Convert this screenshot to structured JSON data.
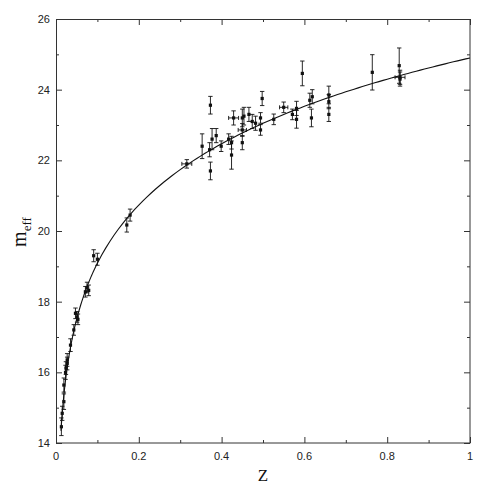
{
  "chart_data": {
    "type": "scatter",
    "title": "",
    "xlabel": "Z",
    "ylabel": "m_eff",
    "ylabel_main": "m",
    "ylabel_sub": "eff",
    "xlim": [
      0,
      1
    ],
    "ylim": [
      14,
      26
    ],
    "x_ticks": [
      0,
      0.2,
      0.4,
      0.6,
      0.8,
      1
    ],
    "x_tick_labels": [
      "0",
      "0.2",
      "0.4",
      "0.6",
      "0.8",
      "1"
    ],
    "x_minor_ticks": [
      0.1,
      0.3,
      0.5,
      0.7,
      0.9
    ],
    "y_ticks": [
      14,
      16,
      18,
      20,
      22,
      24,
      26
    ],
    "y_tick_labels": [
      "14",
      "16",
      "18",
      "20",
      "22",
      "24",
      "26"
    ],
    "y_minor_ticks": [
      15,
      17,
      19,
      21,
      23,
      25
    ],
    "grid": false,
    "legend": null,
    "fit_curve": {
      "description": "Best-fit magnitude-redshift relation (flat cosmology)",
      "omega_m": 0.28,
      "omega_lambda": 0.72,
      "M_offset": 23.93,
      "z_range": [
        0.008,
        1.0
      ]
    },
    "series": [
      {
        "name": "Supernovae",
        "points": [
          {
            "z": 0.013,
            "m": 14.46,
            "err": 0.25
          },
          {
            "z": 0.015,
            "m": 14.84,
            "err": 0.2
          },
          {
            "z": 0.019,
            "m": 15.17,
            "err": 0.22
          },
          {
            "z": 0.019,
            "m": 15.64,
            "err": 0.2
          },
          {
            "z": 0.023,
            "m": 16.0,
            "err": 0.2
          },
          {
            "z": 0.024,
            "m": 16.12,
            "err": 0.18
          },
          {
            "z": 0.027,
            "m": 16.25,
            "err": 0.18
          },
          {
            "z": 0.027,
            "m": 16.35,
            "err": 0.18
          },
          {
            "z": 0.035,
            "m": 16.77,
            "err": 0.18
          },
          {
            "z": 0.043,
            "m": 17.2,
            "err": 0.15
          },
          {
            "z": 0.047,
            "m": 17.67,
            "err": 0.15
          },
          {
            "z": 0.051,
            "m": 17.57,
            "err": 0.15
          },
          {
            "z": 0.053,
            "m": 17.5,
            "err": 0.15
          },
          {
            "z": 0.071,
            "m": 18.28,
            "err": 0.15
          },
          {
            "z": 0.075,
            "m": 18.4,
            "err": 0.15
          },
          {
            "z": 0.079,
            "m": 18.32,
            "err": 0.15
          },
          {
            "z": 0.091,
            "m": 19.3,
            "err": 0.17
          },
          {
            "z": 0.1,
            "m": 19.2,
            "err": 0.17
          },
          {
            "z": 0.171,
            "m": 20.17,
            "err": 0.2
          },
          {
            "z": 0.179,
            "m": 20.45,
            "err": 0.17
          },
          {
            "z": 0.316,
            "m": 21.9,
            "err": 0.12,
            "xerr": 0.012
          },
          {
            "z": 0.353,
            "m": 22.4,
            "err": 0.35
          },
          {
            "z": 0.371,
            "m": 22.3,
            "err": 0.2
          },
          {
            "z": 0.373,
            "m": 23.56,
            "err": 0.25
          },
          {
            "z": 0.373,
            "m": 21.7,
            "err": 0.25
          },
          {
            "z": 0.377,
            "m": 22.6,
            "err": 0.3
          },
          {
            "z": 0.387,
            "m": 22.7,
            "err": 0.2
          },
          {
            "z": 0.399,
            "m": 22.4,
            "err": 0.15
          },
          {
            "z": 0.417,
            "m": 22.6,
            "err": 0.15
          },
          {
            "z": 0.424,
            "m": 22.15,
            "err": 0.4
          },
          {
            "z": 0.424,
            "m": 22.5,
            "err": 0.18
          },
          {
            "z": 0.429,
            "m": 23.2,
            "err": 0.2,
            "xerr": 0.012
          },
          {
            "z": 0.45,
            "m": 23.2,
            "err": 0.25
          },
          {
            "z": 0.454,
            "m": 23.25,
            "err": 0.25
          },
          {
            "z": 0.466,
            "m": 23.3,
            "err": 0.2
          },
          {
            "z": 0.45,
            "m": 22.86,
            "err": 0.18,
            "xerr": 0.01
          },
          {
            "z": 0.45,
            "m": 22.5,
            "err": 0.2
          },
          {
            "z": 0.474,
            "m": 23.1,
            "err": 0.2
          },
          {
            "z": 0.482,
            "m": 23.05,
            "err": 0.2
          },
          {
            "z": 0.494,
            "m": 23.2,
            "err": 0.15
          },
          {
            "z": 0.494,
            "m": 22.86,
            "err": 0.15
          },
          {
            "z": 0.498,
            "m": 23.75,
            "err": 0.2
          },
          {
            "z": 0.526,
            "m": 23.16,
            "err": 0.15
          },
          {
            "z": 0.55,
            "m": 23.5,
            "err": 0.15,
            "xerr": 0.01
          },
          {
            "z": 0.571,
            "m": 23.3,
            "err": 0.15
          },
          {
            "z": 0.581,
            "m": 23.47,
            "err": 0.2
          },
          {
            "z": 0.581,
            "m": 23.16,
            "err": 0.25
          },
          {
            "z": 0.595,
            "m": 24.46,
            "err": 0.35
          },
          {
            "z": 0.613,
            "m": 23.7,
            "err": 0.2
          },
          {
            "z": 0.619,
            "m": 23.8,
            "err": 0.2
          },
          {
            "z": 0.617,
            "m": 23.2,
            "err": 0.25
          },
          {
            "z": 0.659,
            "m": 23.85,
            "err": 0.25
          },
          {
            "z": 0.659,
            "m": 23.66,
            "err": 0.2
          },
          {
            "z": 0.659,
            "m": 23.3,
            "err": 0.2
          },
          {
            "z": 0.764,
            "m": 24.49,
            "err": 0.5
          },
          {
            "z": 0.829,
            "m": 24.68,
            "err": 0.5
          },
          {
            "z": 0.831,
            "m": 24.35,
            "err": 0.2,
            "xerr": 0.012
          },
          {
            "z": 0.831,
            "m": 24.3,
            "err": 0.2
          }
        ]
      }
    ]
  },
  "layout": {
    "plot_left": 56,
    "plot_right": 470,
    "plot_top": 19,
    "plot_bottom": 443
  }
}
